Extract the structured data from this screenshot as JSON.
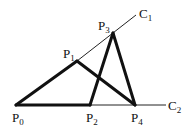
{
  "diagram": {
    "points": [
      {
        "id": "P0",
        "label": "P",
        "sub": "0",
        "x": 16,
        "y": 105
      },
      {
        "id": "P1",
        "label": "P",
        "sub": "1",
        "x": 77,
        "y": 61
      },
      {
        "id": "P2",
        "label": "P",
        "sub": "2",
        "x": 90,
        "y": 105
      },
      {
        "id": "P3",
        "label": "P",
        "sub": "3",
        "x": 113,
        "y": 33
      },
      {
        "id": "P4",
        "label": "P",
        "sub": "4",
        "x": 135,
        "y": 105
      }
    ],
    "curves": [
      {
        "id": "C1",
        "label": "C",
        "sub": "1"
      },
      {
        "id": "C2",
        "label": "C",
        "sub": "2"
      }
    ],
    "thick_edges": [
      [
        "P0",
        "P1"
      ],
      [
        "P1",
        "P4"
      ],
      [
        "P0",
        "P2"
      ],
      [
        "P2",
        "P3"
      ],
      [
        "P3",
        "P4"
      ]
    ],
    "line_color": "#111111"
  }
}
